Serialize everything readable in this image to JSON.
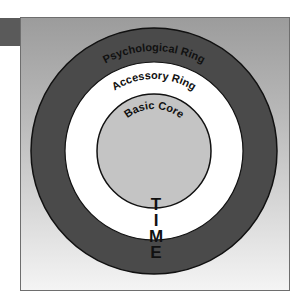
{
  "diagram": {
    "title": "",
    "rings": [
      {
        "id": "psychological",
        "label": "Psychological Ring",
        "fill": "#4a4a4a"
      },
      {
        "id": "accessory",
        "label": "Accessory Ring",
        "fill": "#ffffff"
      },
      {
        "id": "core",
        "label": "Basic Core",
        "fill": "#c4c4c4"
      }
    ],
    "time_axis": {
      "letters": [
        "T",
        "I",
        "M",
        "E"
      ],
      "word": "TIME"
    },
    "colors": {
      "tab": "#5a5a5a",
      "frame_border": "#6e6e6e",
      "stroke": "#111111"
    }
  }
}
